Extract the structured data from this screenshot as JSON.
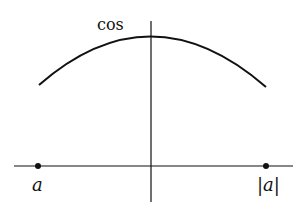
{
  "diagram": {
    "function_label": "cos",
    "left_point_label": "a",
    "right_point_label": "|a|",
    "colors": {
      "stroke": "#111111",
      "background": "#ffffff"
    }
  }
}
